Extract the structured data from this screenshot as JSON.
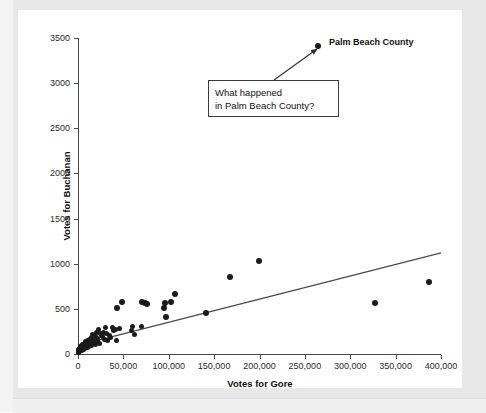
{
  "chart_data": {
    "type": "scatter",
    "title": "",
    "xlabel": "Votes for Gore",
    "ylabel": "Votes for Buchanan",
    "xlim": [
      0,
      400000
    ],
    "ylim": [
      0,
      3500
    ],
    "grid": false,
    "legend": "none",
    "x_ticks": [
      0,
      50000,
      100000,
      150000,
      200000,
      250000,
      300000,
      350000,
      400000
    ],
    "x_tick_labels": [
      "0",
      "50,000",
      "100,000",
      "150,000",
      "200,000",
      "250,000",
      "300,000",
      "350,000",
      "400,000"
    ],
    "y_ticks": [
      0,
      500,
      1000,
      1500,
      2000,
      2500,
      3000,
      3500
    ],
    "y_tick_labels": [
      "0",
      "500",
      "1000",
      "1500",
      "2000",
      "2500",
      "3000",
      "3500"
    ],
    "point_color": "#1b1b1b",
    "line_color": "#4a4a4a",
    "series": [
      {
        "name": "Florida counties",
        "x": [
          265000,
          386500,
          327000,
          199000,
          167500,
          141000,
          107000,
          103000,
          96500,
          96000,
          95000,
          76000,
          73500,
          70500,
          69500,
          62000,
          60500,
          58500,
          48000,
          46000,
          43500,
          42500,
          41000,
          39000,
          37500,
          36000,
          34500,
          33000,
          31500,
          30000,
          29500,
          28500,
          27000,
          26000,
          25000,
          24000,
          23000,
          22000,
          21000,
          20500,
          19500,
          19000,
          18000,
          17500,
          17000,
          16000,
          15500,
          15000,
          14500,
          14000,
          13500,
          13000,
          12500,
          12000,
          11500,
          11000,
          10500,
          10000,
          9500,
          9000,
          8500,
          8000,
          7500,
          7000,
          6800,
          6500,
          6200,
          6000,
          5800,
          5500,
          5200,
          5000,
          4800,
          4500,
          4200,
          4000,
          3800,
          3500,
          3200,
          3000,
          2800,
          2500,
          2200,
          2000,
          1800,
          1500,
          1200,
          1000,
          800,
          600,
          400,
          200
        ],
        "y": [
          3411,
          800,
          570,
          1030,
          850,
          450,
          660,
          580,
          410,
          570,
          505,
          550,
          570,
          580,
          305,
          220,
          310,
          260,
          580,
          285,
          510,
          145,
          270,
          255,
          290,
          180,
          210,
          145,
          230,
          290,
          165,
          240,
          195,
          200,
          230,
          120,
          270,
          175,
          150,
          235,
          190,
          105,
          205,
          140,
          125,
          215,
          165,
          95,
          180,
          130,
          110,
          160,
          145,
          85,
          125,
          100,
          150,
          75,
          115,
          90,
          135,
          70,
          105,
          60,
          120,
          80,
          95,
          55,
          110,
          65,
          85,
          45,
          100,
          70,
          55,
          90,
          40,
          75,
          50,
          60,
          35,
          80,
          45,
          55,
          30,
          65,
          40,
          50,
          25,
          35,
          20,
          28
        ]
      }
    ],
    "trend_line": {
      "label": "least-squares regression line",
      "x_start": 0,
      "y_start": 95,
      "x_end": 400000,
      "y_end": 1120
    },
    "annotations": [
      {
        "name": "palm-beach-county-label",
        "text": "Palm Beach County",
        "x": 265000,
        "y": 3411
      },
      {
        "name": "callout",
        "text": "What happened\nin Palm Beach County?",
        "points_to_x": 265000,
        "points_to_y": 3411
      }
    ]
  },
  "axes": {
    "x_title": "Votes for Gore",
    "y_title": "Votes for Buchanan"
  },
  "labels": {
    "palm_beach": "Palm Beach County",
    "callout": "What happened\nin Palm Beach County?"
  },
  "colors": {
    "point": "#1b1b1b",
    "line": "#4a4a4a",
    "plot_background": "#ffffff",
    "figure_background": "#e8e8e8"
  },
  "watermark": {
    "line1": "chapter text showing through from the printed page",
    "line2": "Correlation Does Not Imply Causation",
    "line3": "faint show-through of body copy below the figure"
  }
}
